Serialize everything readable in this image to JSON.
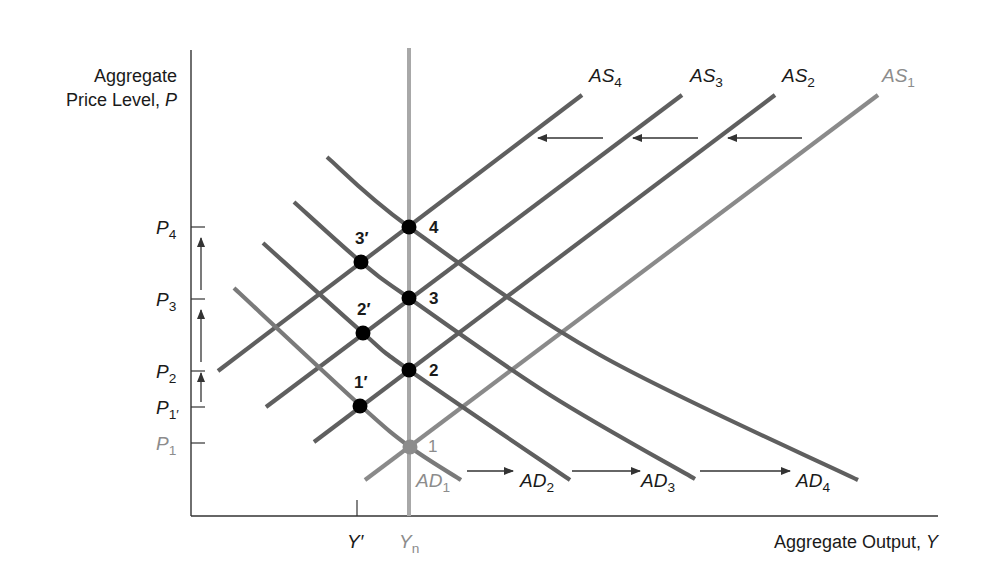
{
  "chart_data": {
    "type": "line",
    "title": "",
    "ylabel": "Aggregate Price Level, P",
    "ylabel_lines": [
      "Aggregate",
      "Price Level, "
    ],
    "ylabel_var": "P",
    "xlabel": "Aggregate Output, Y",
    "xlabel_text": "Aggregate Output, ",
    "xlabel_var": "Y",
    "y_ticks": [
      {
        "label": "P",
        "sub": "4",
        "y": 227,
        "color": "#1a1a1a"
      },
      {
        "label": "P",
        "sub": "3",
        "y": 299,
        "color": "#1a1a1a"
      },
      {
        "label": "P",
        "sub": "2",
        "y": 371,
        "color": "#1a1a1a"
      },
      {
        "label": "P",
        "sub": "1′",
        "y": 407,
        "color": "#1a1a1a"
      },
      {
        "label": "P",
        "sub": "1",
        "y": 443,
        "color": "#8c8c8c"
      }
    ],
    "x_ticks": [
      {
        "label": "Y′",
        "sub": "",
        "x": 357,
        "color": "#1a1a1a"
      },
      {
        "label": "Y",
        "sub": "n",
        "x": 409,
        "color": "#8c8c8c"
      }
    ],
    "series": [
      {
        "name": "AS1",
        "label": "AS",
        "sub": "1",
        "kind": "supply",
        "color": "#8a8a8a",
        "label_color": "#8c8c8c",
        "points": [
          [
            365,
            480
          ],
          [
            878,
            95
          ]
        ],
        "label_pos": [
          882,
          82
        ]
      },
      {
        "name": "AS2",
        "label": "AS",
        "sub": "2",
        "kind": "supply",
        "color": "#5f5f5f",
        "label_color": "#1a1a1a",
        "points": [
          [
            314,
            442
          ],
          [
            775,
            95
          ]
        ],
        "label_pos": [
          782,
          82
        ]
      },
      {
        "name": "AS3",
        "label": "AS",
        "sub": "3",
        "kind": "supply",
        "color": "#5f5f5f",
        "label_color": "#1a1a1a",
        "points": [
          [
            266,
            407
          ],
          [
            682,
            95
          ]
        ],
        "label_pos": [
          690,
          82
        ]
      },
      {
        "name": "AS4",
        "label": "AS",
        "sub": "4",
        "kind": "supply",
        "color": "#5f5f5f",
        "label_color": "#1a1a1a",
        "points": [
          [
            218,
            371
          ],
          [
            582,
            95
          ]
        ],
        "label_pos": [
          589,
          82
        ]
      },
      {
        "name": "AD1",
        "label": "AD",
        "sub": "1",
        "kind": "demand",
        "color": "#7a7a7a",
        "label_color": "#8c8c8c",
        "points": [
          [
            234,
            288
          ],
          [
            361,
            406
          ],
          [
            410,
            447
          ],
          [
            461,
            480
          ]
        ],
        "label_pos": [
          416,
          487
        ]
      },
      {
        "name": "AD2",
        "label": "AD",
        "sub": "2",
        "kind": "demand",
        "color": "#5f5f5f",
        "label_color": "#1a1a1a",
        "points": [
          [
            263,
            243
          ],
          [
            363,
            333
          ],
          [
            409,
            370
          ],
          [
            570,
            480
          ]
        ],
        "label_pos": [
          520,
          487
        ]
      },
      {
        "name": "AD3",
        "label": "AD",
        "sub": "3",
        "kind": "demand",
        "color": "#5f5f5f",
        "label_color": "#1a1a1a",
        "points": [
          [
            294,
            202
          ],
          [
            361,
            262
          ],
          [
            409,
            298
          ],
          [
            550,
            395
          ],
          [
            695,
            479
          ]
        ],
        "label_pos": [
          641,
          487
        ]
      },
      {
        "name": "AD4",
        "label": "AD",
        "sub": "4",
        "kind": "demand",
        "color": "#5f5f5f",
        "label_color": "#1a1a1a",
        "points": [
          [
            327,
            157
          ],
          [
            409,
            227
          ],
          [
            600,
            355
          ],
          [
            858,
            480
          ]
        ],
        "label_pos": [
          796,
          487
        ]
      }
    ],
    "vertical_line": {
      "name": "Yn",
      "x": 409,
      "y_top": 48,
      "y_bottom": 516,
      "color": "#a8a8a8"
    },
    "points": [
      {
        "label": "4",
        "x": 409,
        "y": 227,
        "color": "#000000",
        "label_color": "#1a1a1a",
        "label_dx": 20,
        "label_dy": 6
      },
      {
        "label": "3′",
        "x": 361,
        "y": 262,
        "color": "#000000",
        "label_color": "#1a1a1a",
        "label_dx": -6,
        "label_dy": -18
      },
      {
        "label": "3",
        "x": 409,
        "y": 298,
        "color": "#000000",
        "label_color": "#1a1a1a",
        "label_dx": 20,
        "label_dy": 6
      },
      {
        "label": "2′",
        "x": 363,
        "y": 333,
        "color": "#000000",
        "label_color": "#1a1a1a",
        "label_dx": -6,
        "label_dy": -18
      },
      {
        "label": "2",
        "x": 409,
        "y": 370,
        "color": "#000000",
        "label_color": "#1a1a1a",
        "label_dx": 20,
        "label_dy": 6
      },
      {
        "label": "1′",
        "x": 360,
        "y": 406,
        "color": "#000000",
        "label_color": "#1a1a1a",
        "label_dx": -6,
        "label_dy": -18
      },
      {
        "label": "1",
        "x": 410,
        "y": 447,
        "color": "#8c8c8c",
        "label_color": "#8c8c8c",
        "label_dx": 18,
        "label_dy": 5
      }
    ],
    "arrows": [
      {
        "from": [
          603,
          138
        ],
        "to": [
          538,
          138
        ],
        "direction": "left"
      },
      {
        "from": [
          698,
          138
        ],
        "to": [
          633,
          138
        ],
        "direction": "left"
      },
      {
        "from": [
          802,
          138
        ],
        "to": [
          728,
          138
        ],
        "direction": "left"
      },
      {
        "from": [
          467,
          471
        ],
        "to": [
          513,
          471
        ],
        "direction": "right"
      },
      {
        "from": [
          572,
          471
        ],
        "to": [
          640,
          471
        ],
        "direction": "right"
      },
      {
        "from": [
          700,
          471
        ],
        "to": [
          790,
          471
        ],
        "direction": "right"
      },
      {
        "from": [
          201,
          290
        ],
        "to": [
          201,
          238
        ],
        "direction": "up"
      },
      {
        "from": [
          201,
          362
        ],
        "to": [
          201,
          310
        ],
        "direction": "up"
      },
      {
        "from": [
          201,
          402
        ],
        "to": [
          201,
          373
        ],
        "direction": "up"
      }
    ],
    "axes": {
      "origin": [
        191,
        516
      ],
      "x_end": 938,
      "y_top": 50
    },
    "grid": false,
    "legend": "none (inline curve labels)"
  }
}
